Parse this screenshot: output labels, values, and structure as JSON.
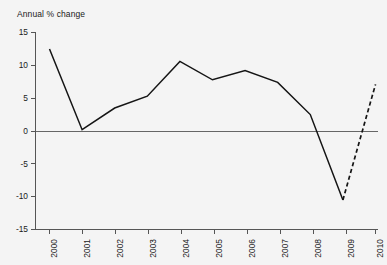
{
  "chart_data": {
    "type": "line",
    "title": "Annual % change",
    "xlabel": "",
    "ylabel": "",
    "categories": [
      "2000",
      "2001",
      "2002",
      "2003",
      "2004",
      "2005",
      "2006",
      "2007",
      "2008",
      "2009",
      "2010"
    ],
    "series": [
      {
        "name": "Annual % change",
        "style": "solid",
        "values": [
          12.5,
          0.2,
          3.5,
          5.3,
          10.6,
          7.8,
          9.2,
          7.4,
          2.5,
          -10.5,
          null
        ]
      },
      {
        "name": "Forecast",
        "style": "dashed",
        "values": [
          null,
          null,
          null,
          null,
          null,
          null,
          null,
          null,
          null,
          -10.5,
          7.1
        ]
      }
    ],
    "ylim": [
      -15,
      15
    ],
    "yticks": [
      15,
      10,
      5,
      0,
      -5,
      -10,
      -15
    ],
    "ytick_labels": [
      "15",
      "10",
      "5",
      "0",
      "-5",
      "-10",
      "-15"
    ],
    "xtick_labels": [
      "2000",
      "2001",
      "2002",
      "2003",
      "2004",
      "2005",
      "2006",
      "2007",
      "2008",
      "2009",
      "2010"
    ],
    "grid": false,
    "legend": null,
    "zero_line": 0,
    "line_color": "#151515",
    "axis_color": "#555555",
    "background_color": "#f4f4f4"
  },
  "chart": {
    "title": "Annual % change"
  }
}
